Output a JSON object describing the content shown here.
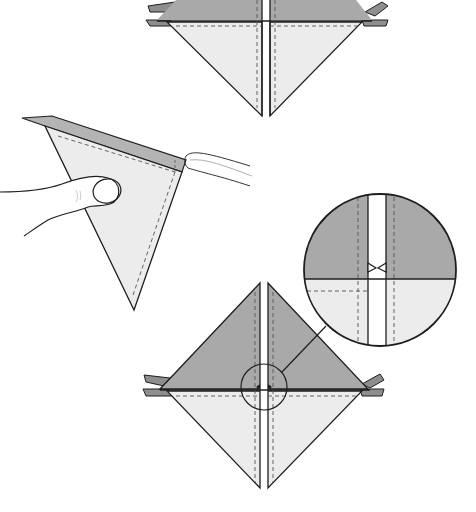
{
  "diagram": {
    "type": "origami-instruction-illustration",
    "colors": {
      "dark_paper": "#a9a9a9",
      "light_paper": "#ececec",
      "outline": "#1e1e1e",
      "dashed_crease": "#555555",
      "background": "#ffffff",
      "tab": "#8e8e8e"
    },
    "steps": [
      {
        "id": "step-top",
        "label": "Top diamond (partially visible) — bottom half light, top half dark, center slit"
      },
      {
        "id": "step-hand",
        "label": "Hand holding triangular flap, creasing along the top edge"
      },
      {
        "id": "step-bottom",
        "label": "Completed diamond with center slit and detail circle"
      },
      {
        "id": "detail",
        "label": "Magnified view of center notch at slit"
      }
    ]
  }
}
